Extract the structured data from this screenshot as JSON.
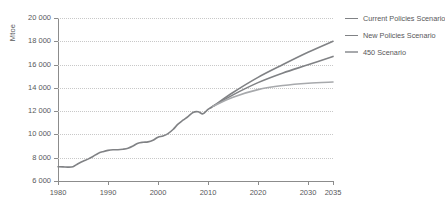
{
  "chart_data": {
    "type": "line",
    "title": "",
    "xlabel": "",
    "ylabel": "Mtoe",
    "xlim": [
      1980,
      2035
    ],
    "ylim": [
      6000,
      20000
    ],
    "grid": true,
    "legend_position": "right",
    "x_ticks": [
      "1980",
      "1990",
      "2000",
      "2010",
      "2020",
      "2030",
      "2035"
    ],
    "x_tick_values": [
      1980,
      1990,
      2000,
      2010,
      2020,
      2030,
      2035
    ],
    "y_ticks": [
      "6 000",
      "8 000",
      "10 000",
      "12 000",
      "14 000",
      "16 000",
      "18 000",
      "20 000"
    ],
    "y_tick_values": [
      6000,
      8000,
      10000,
      12000,
      14000,
      16000,
      18000,
      20000
    ],
    "series": [
      {
        "name": "Current Policies Scenario",
        "color": "#808285",
        "x": [
          1980,
          1981,
          1982,
          1983,
          1984,
          1985,
          1986,
          1987,
          1988,
          1989,
          1990,
          1991,
          1992,
          1993,
          1994,
          1995,
          1996,
          1997,
          1998,
          1999,
          2000,
          2001,
          2002,
          2003,
          2004,
          2005,
          2006,
          2007,
          2008,
          2009,
          2010,
          2011,
          2015,
          2020,
          2025,
          2030,
          2035
        ],
        "values": [
          7220,
          7210,
          7190,
          7230,
          7480,
          7700,
          7880,
          8110,
          8370,
          8520,
          8630,
          8680,
          8680,
          8730,
          8820,
          9010,
          9250,
          9330,
          9360,
          9500,
          9760,
          9870,
          10070,
          10420,
          10880,
          11220,
          11530,
          11890,
          11950,
          11770,
          12150,
          12420,
          13600,
          14900,
          16000,
          17050,
          18000
        ]
      },
      {
        "name": "New Policies Scenario",
        "color": "#808285",
        "x": [
          2011,
          2015,
          2020,
          2025,
          2030,
          2035
        ],
        "values": [
          12420,
          13400,
          14450,
          15280,
          15980,
          16700
        ]
      },
      {
        "name": "450 Scenario",
        "color": "#a7a9ac",
        "x": [
          2011,
          2015,
          2020,
          2025,
          2030,
          2035
        ],
        "values": [
          12420,
          13200,
          13850,
          14200,
          14400,
          14500
        ]
      }
    ]
  },
  "legend": {
    "items": [
      {
        "label": "Current Policies Scenario",
        "color": "#808285"
      },
      {
        "label": "New Policies Scenario",
        "color": "#808285"
      },
      {
        "label": "450 Scenario",
        "color": "#a7a9ac"
      }
    ]
  },
  "axes": {
    "y_title": "Mtoe"
  }
}
